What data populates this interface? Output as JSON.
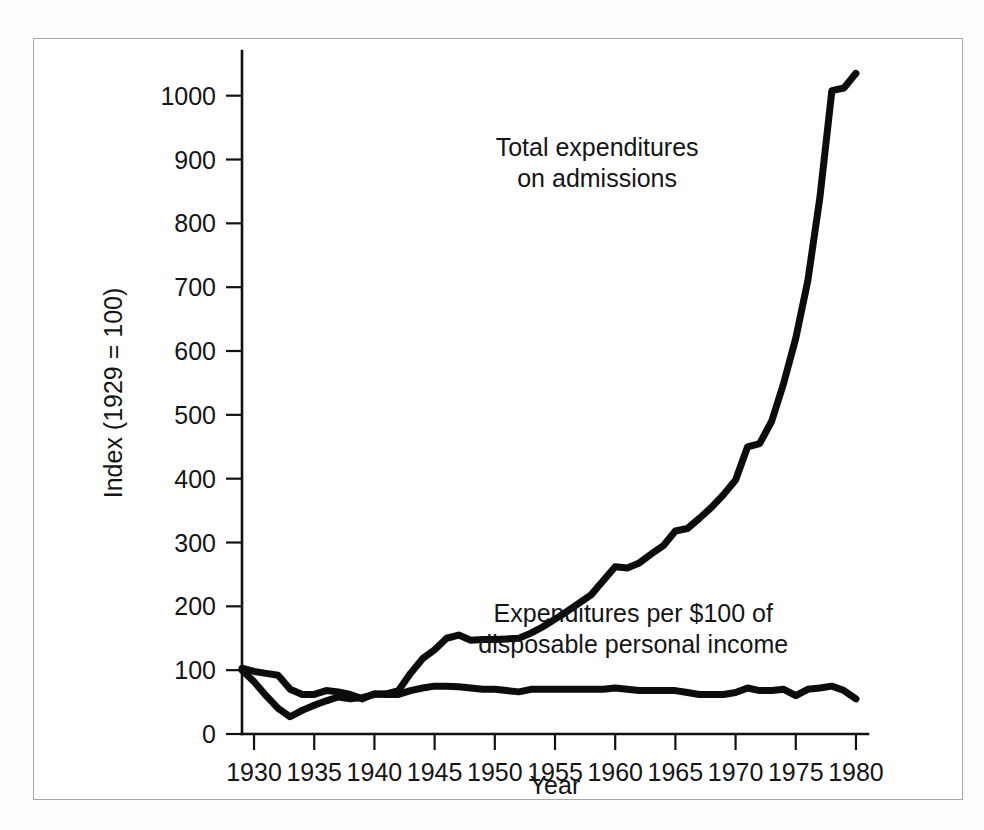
{
  "chart_data": {
    "type": "line",
    "title": "",
    "xlabel": "Year",
    "ylabel": "Index (1929 = 100)",
    "xlim": [
      1929,
      1981
    ],
    "ylim": [
      0,
      1070
    ],
    "grid": false,
    "legend_position": "inline-annotation",
    "xticks": [
      1930,
      1935,
      1940,
      1945,
      1950,
      1955,
      1960,
      1965,
      1970,
      1975,
      1980
    ],
    "xtick_labels": [
      "1930",
      "1935",
      "1940",
      "1945",
      "1950",
      "1955",
      "1960",
      "1965",
      "1970",
      "1975",
      "1980"
    ],
    "yticks": [
      0,
      100,
      200,
      300,
      400,
      500,
      600,
      700,
      800,
      900,
      1000
    ],
    "ytick_labels": [
      "0",
      "100",
      "200",
      "300",
      "400",
      "500",
      "600",
      "700",
      "800",
      "900",
      "1000"
    ],
    "annotations": [
      {
        "name": "total-expenditures-label",
        "lines": [
          "Total expenditures",
          "on admissions"
        ],
        "x": 1958.5,
        "y": 905
      },
      {
        "name": "expenditures-per-100-label",
        "lines": [
          "Expenditures per $100 of",
          "disposable personal income"
        ],
        "x": 1961.5,
        "y": 175
      }
    ],
    "series": [
      {
        "name": "Total expenditures on admissions",
        "label": "Total expenditures on admissions",
        "color": "#0c0c0c",
        "stroke_width": 7,
        "x": [
          1929,
          1930,
          1931,
          1932,
          1933,
          1934,
          1935,
          1936,
          1937,
          1938,
          1939,
          1940,
          1941,
          1942,
          1943,
          1944,
          1945,
          1946,
          1947,
          1948,
          1949,
          1950,
          1951,
          1952,
          1953,
          1954,
          1955,
          1956,
          1957,
          1958,
          1959,
          1960,
          1961,
          1962,
          1963,
          1964,
          1965,
          1966,
          1967,
          1968,
          1969,
          1970,
          1971,
          1972,
          1973,
          1974,
          1975,
          1976,
          1977,
          1978,
          1979,
          1980
        ],
        "values": [
          100,
          82,
          60,
          40,
          27,
          37,
          45,
          52,
          58,
          55,
          57,
          62,
          63,
          68,
          95,
          118,
          132,
          150,
          155,
          147,
          148,
          148,
          149,
          150,
          158,
          168,
          180,
          192,
          205,
          218,
          240,
          262,
          260,
          268,
          282,
          295,
          318,
          322,
          338,
          355,
          375,
          398,
          450,
          455,
          490,
          550,
          620,
          710,
          840,
          1008,
          1012,
          1035
        ]
      },
      {
        "name": "Expenditures per $100 of disposable personal income",
        "label": "Expenditures per $100 of disposable personal income",
        "color": "#0c0c0c",
        "stroke_width": 7,
        "x": [
          1929,
          1930,
          1931,
          1932,
          1933,
          1934,
          1935,
          1936,
          1937,
          1938,
          1939,
          1940,
          1941,
          1942,
          1943,
          1944,
          1945,
          1946,
          1947,
          1948,
          1949,
          1950,
          1951,
          1952,
          1953,
          1954,
          1955,
          1956,
          1957,
          1958,
          1959,
          1960,
          1961,
          1962,
          1963,
          1964,
          1965,
          1966,
          1967,
          1968,
          1969,
          1970,
          1971,
          1972,
          1973,
          1974,
          1975,
          1976,
          1977,
          1978,
          1979,
          1980
        ],
        "values": [
          103,
          98,
          95,
          92,
          70,
          62,
          62,
          68,
          66,
          62,
          55,
          63,
          62,
          62,
          68,
          72,
          75,
          75,
          74,
          72,
          70,
          70,
          68,
          66,
          70,
          70,
          70,
          70,
          70,
          70,
          70,
          72,
          70,
          68,
          68,
          68,
          68,
          65,
          62,
          62,
          62,
          65,
          72,
          68,
          68,
          70,
          60,
          70,
          72,
          75,
          68,
          55
        ]
      }
    ]
  }
}
